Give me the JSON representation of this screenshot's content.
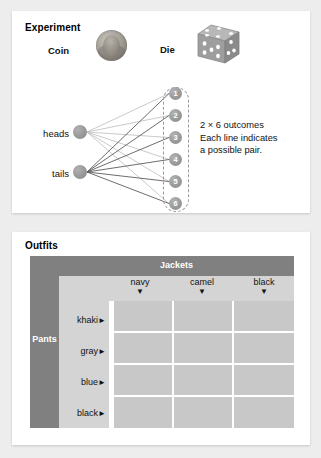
{
  "page": {
    "background_color": "#ededed"
  },
  "experiment": {
    "title": "Experiment",
    "coin_label": "Coin",
    "die_label": "Die",
    "coin_icon": "penny-coin-image",
    "die_icon": "six-sided-die-image",
    "coin_outcomes": [
      "heads",
      "tails"
    ],
    "die_outcomes": [
      "1",
      "2",
      "3",
      "4",
      "5",
      "6"
    ],
    "note": "2 × 6 outcomes\nEach line indicates\na possible pair.",
    "colors": {
      "node_gray": "#9a9a9a",
      "group_dash": "#9a9a9a",
      "heads_link": "#b9b9b9",
      "tails_link": "#5a5a5a"
    }
  },
  "outfits": {
    "title": "Outfits",
    "column_group_label": "Jackets",
    "row_group_label": "Pants",
    "columns": [
      "navy",
      "camel",
      "black"
    ],
    "column_arrow": "▼",
    "rows": [
      "khaki",
      "gray",
      "blue",
      "black"
    ],
    "row_arrow": "►",
    "cells": [
      [
        "",
        "",
        ""
      ],
      [
        "",
        "",
        ""
      ],
      [
        "",
        "",
        ""
      ],
      [
        "",
        "",
        ""
      ]
    ],
    "colors": {
      "header_gray": "#808080",
      "band_gray": "#d4d4d4",
      "cell_gray": "#c8c8c8",
      "grid_line": "#ffffff"
    }
  }
}
